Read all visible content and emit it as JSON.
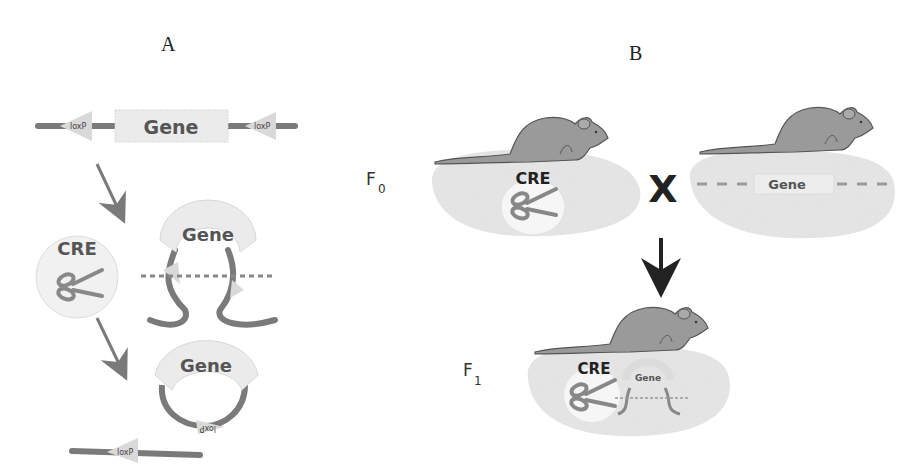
{
  "figure": {
    "panel_a": {
      "label": "A",
      "gene_label": "Gene",
      "loxp_label": "loxP",
      "cre_label": "CRE",
      "scissors_icon": "scissors-icon"
    },
    "panel_b": {
      "label": "B",
      "f0_label": "F",
      "f0_sub": "0",
      "f1_label": "F",
      "f1_sub": "1",
      "cross_symbol": "X",
      "cre_label": "CRE",
      "gene_label": "Gene",
      "mouse_icon": "mouse-icon",
      "arrow_icon": "arrow-down-icon"
    },
    "colors": {
      "dna": "#7a7a7a",
      "gene_box": "#ebebeb",
      "loxp": "#d9d9d9",
      "arrow": "#7a7a7a",
      "blob": "#e6e6e6",
      "mouse": "#9a9a9a",
      "text_dark": "#222222"
    }
  }
}
